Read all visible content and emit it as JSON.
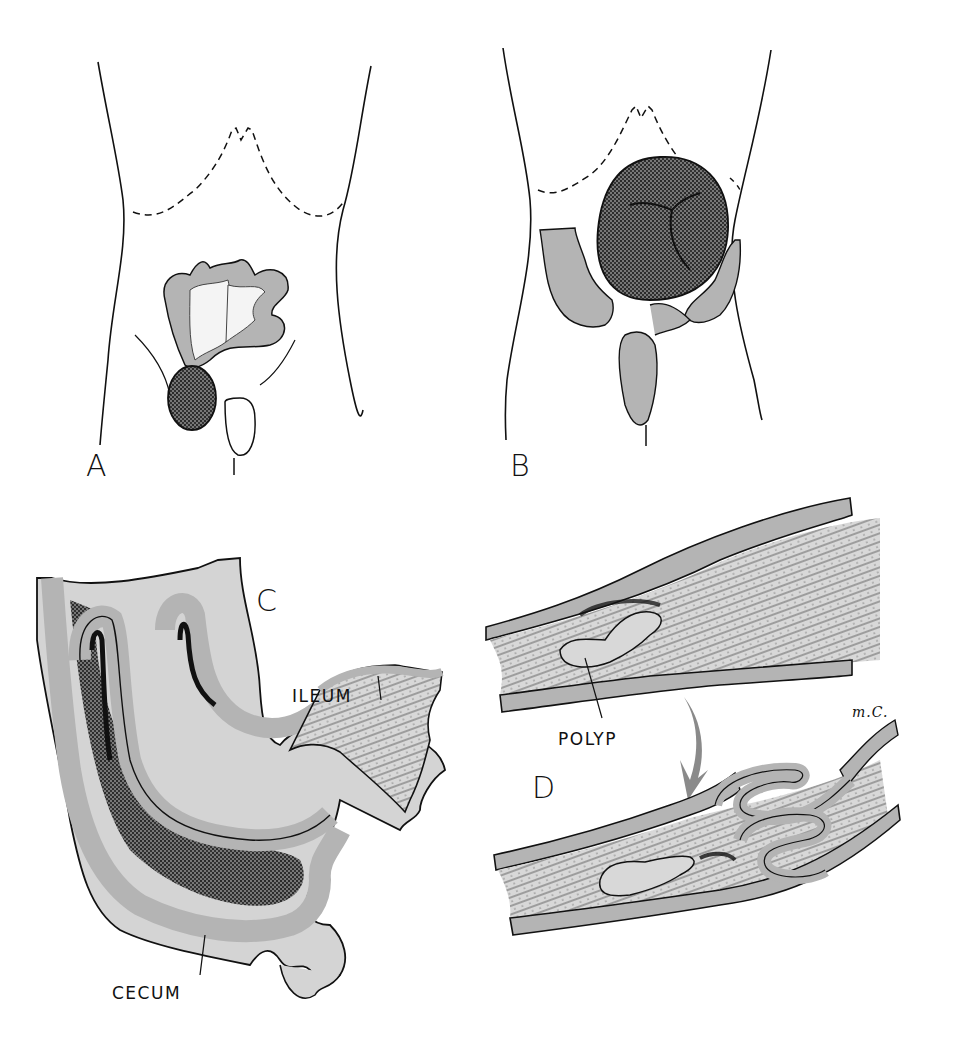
{
  "figure": {
    "colors": {
      "wall": "#b4b4b4",
      "mucosa": "#d6d6d6",
      "mucosa_dark": "#3c3c3c",
      "ink": "#111111",
      "arrow": "#8a8a8a",
      "background": "#ffffff"
    },
    "panels": [
      {
        "id": "A",
        "label": "A",
        "description": "Abdomen outline with exteriorized bowel loop and intussusception mass"
      },
      {
        "id": "B",
        "label": "B",
        "description": "Abdomen outline with large intussusception mass and colon"
      },
      {
        "id": "C",
        "label": "C",
        "description": "Cut-away ileocecal intussusception",
        "callouts": [
          {
            "text": "ILEUM"
          },
          {
            "text": "CECUM"
          }
        ]
      },
      {
        "id": "D",
        "label": "D",
        "description": "Polyp acting as lead point, before and after telescoping",
        "callouts": [
          {
            "text": "POLYP"
          }
        ]
      }
    ],
    "signature": "m.C."
  }
}
